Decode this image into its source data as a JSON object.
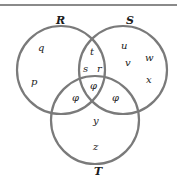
{
  "diagram": {
    "type": "venn",
    "sets": [
      {
        "name": "R",
        "cx": 61,
        "cy": 70,
        "r": 44
      },
      {
        "name": "S",
        "cx": 123,
        "cy": 70,
        "r": 44
      },
      {
        "name": "T",
        "cx": 95,
        "cy": 120,
        "r": 44
      }
    ],
    "circle_color": "#7a7a7a",
    "regions": {
      "R_only": [
        "q",
        "p"
      ],
      "S_only": [
        "u",
        "v",
        "w",
        "x"
      ],
      "T_only": [
        "y",
        "z"
      ],
      "R_and_S_only": [
        "t",
        "s",
        "r"
      ],
      "R_and_T_only": [
        "φ"
      ],
      "S_and_T_only": [
        "φ"
      ],
      "R_S_T": [
        "φ"
      ]
    },
    "labels": {
      "R": "R",
      "S": "S",
      "T": "T",
      "q": "q",
      "p": "p",
      "t": "t",
      "s": "s",
      "r": "r",
      "u": "u",
      "v": "v",
      "w": "w",
      "x": "x",
      "phi_rt": "φ",
      "phi_center": "φ",
      "phi_st": "φ",
      "y": "y",
      "z": "z"
    }
  }
}
